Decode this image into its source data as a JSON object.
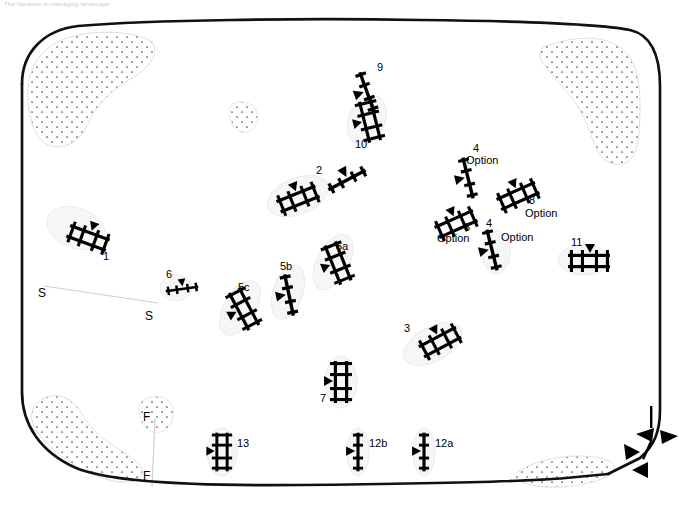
{
  "page": {
    "header_text": "The Variation in managing landscape",
    "background_color": "#ffffff",
    "line_color": "#000000",
    "stipple_color": "#555555"
  },
  "map": {
    "title": "",
    "boundary": {
      "name": "field-boundary-outline",
      "style": "thick rounded closed curve, broken at lower-right",
      "stroke_width": 2.6
    },
    "stipple_regions": [
      {
        "name": "stipple-top-left"
      },
      {
        "name": "stipple-top-right"
      },
      {
        "name": "stipple-bottom-left"
      },
      {
        "name": "stipple-bottom-right"
      },
      {
        "name": "stipple-center-small"
      },
      {
        "name": "stipple-lower-mid"
      }
    ],
    "cross_sections": [
      {
        "id": "S",
        "start_label": "S",
        "end_label": "S"
      },
      {
        "id": "F",
        "start_label": "F",
        "end_label": "F"
      }
    ],
    "edge_markers": {
      "name": "boundary-arrow-marks",
      "count": 4,
      "description": "chevron arrowheads at broken lower-right boundary"
    },
    "features": [
      {
        "id": "1",
        "label": "1",
        "type": "double-rail",
        "x": 76,
        "y": 228,
        "angle": 20,
        "length": 42,
        "label_dx": 26,
        "label_dy": 24
      },
      {
        "id": "2",
        "label": "2",
        "type": "double-rail",
        "x": 278,
        "y": 190,
        "angle": -22,
        "length": 44,
        "label_dx": 42,
        "label_dy": -22
      },
      {
        "id": "2b",
        "label": "",
        "type": "single-rail",
        "x": 330,
        "y": 172,
        "angle": -25,
        "length": 36,
        "label_dx": 0,
        "label_dy": 0
      },
      {
        "id": "3",
        "label": "3",
        "type": "double-rail",
        "x": 421,
        "y": 342,
        "angle": -28,
        "length": 42,
        "label_dx": -16,
        "label_dy": -16
      },
      {
        "id": "4a",
        "label": "4",
        "type": "single-rail",
        "x": 458,
        "y": 150,
        "angle": 66,
        "length": 46,
        "label_dx": 16,
        "label_dy": -6,
        "option": "Option"
      },
      {
        "id": "4b",
        "label": "4",
        "type": "single-rail",
        "x": 482,
        "y": 228,
        "angle": 66,
        "length": 40,
        "label_dx": 14,
        "label_dy": -6,
        "option": "Option"
      },
      {
        "id": "8a",
        "label": "8",
        "type": "double-rail",
        "x": 430,
        "y": 212,
        "angle": -22,
        "length": 44,
        "label_dx": 42,
        "label_dy": 16,
        "option": "Option"
      },
      {
        "id": "8b",
        "label": "8",
        "type": "double-rail",
        "x": 495,
        "y": 184,
        "angle": -22,
        "length": 44,
        "label_dx": 42,
        "label_dy": 12,
        "option": "Option"
      },
      {
        "id": "5a",
        "label": "5a",
        "type": "double-rail",
        "x": 322,
        "y": 248,
        "angle": 62,
        "length": 44,
        "label_dx": 14,
        "label_dy": -6
      },
      {
        "id": "5b",
        "label": "5b",
        "type": "single-rail",
        "x": 278,
        "y": 272,
        "angle": 72,
        "length": 42,
        "label_dx": 8,
        "label_dy": -8
      },
      {
        "id": "5c",
        "label": "5c",
        "type": "double-rail",
        "x": 229,
        "y": 292,
        "angle": 60,
        "length": 44,
        "label_dx": 12,
        "label_dy": -8
      },
      {
        "id": "6",
        "label": "6",
        "type": "single-rail",
        "x": 168,
        "y": 287,
        "angle": -8,
        "length": 32,
        "label_dx": -2,
        "label_dy": -14
      },
      {
        "id": "7",
        "label": "7",
        "type": "double-rail",
        "x": 334,
        "y": 365,
        "angle": 90,
        "length": 42,
        "label_dx": -12,
        "label_dy": 30
      },
      {
        "id": "9",
        "label": "9",
        "type": "single-rail",
        "x": 356,
        "y": 58,
        "angle": 70,
        "length": 46,
        "label_dx": 18,
        "label_dy": 4
      },
      {
        "id": "10",
        "label": "10",
        "type": "double-rail",
        "x": 360,
        "y": 102,
        "angle": 66,
        "length": 42,
        "label_dx": -6,
        "label_dy": 34
      },
      {
        "id": "11",
        "label": "11",
        "type": "double-rail",
        "x": 568,
        "y": 255,
        "angle": 0,
        "length": 42,
        "label_dx": 8,
        "label_dy": -18
      },
      {
        "id": "12a",
        "label": "12a",
        "type": "single-rail",
        "x": 421,
        "y": 437,
        "angle": 90,
        "length": 38,
        "label_dx": 10,
        "label_dy": 0
      },
      {
        "id": "12b",
        "label": "12b",
        "type": "single-rail",
        "x": 355,
        "y": 437,
        "angle": 90,
        "length": 38,
        "label_dx": 10,
        "label_dy": 0
      },
      {
        "id": "13",
        "label": "13",
        "type": "double-rail",
        "x": 216,
        "y": 437,
        "angle": 90,
        "length": 38,
        "label_dx": 16,
        "label_dy": 0
      }
    ],
    "label_texts": {
      "f1": "1",
      "f2": "2",
      "f3": "3",
      "f5a": "5a",
      "f5b": "5b",
      "f5c": "5c",
      "f6": "6",
      "f7": "7",
      "f9": "9",
      "f10": "10",
      "f11": "11",
      "f12a": "12a",
      "f12b": "12b",
      "f13": "13",
      "f4_top": "4",
      "f4_bottom": "4",
      "f8_left": "8",
      "f8_right": "8",
      "option": "Option",
      "section_s_left": "S",
      "section_s_right": "S",
      "section_f_top": "F",
      "section_f_bottom": "F"
    }
  }
}
